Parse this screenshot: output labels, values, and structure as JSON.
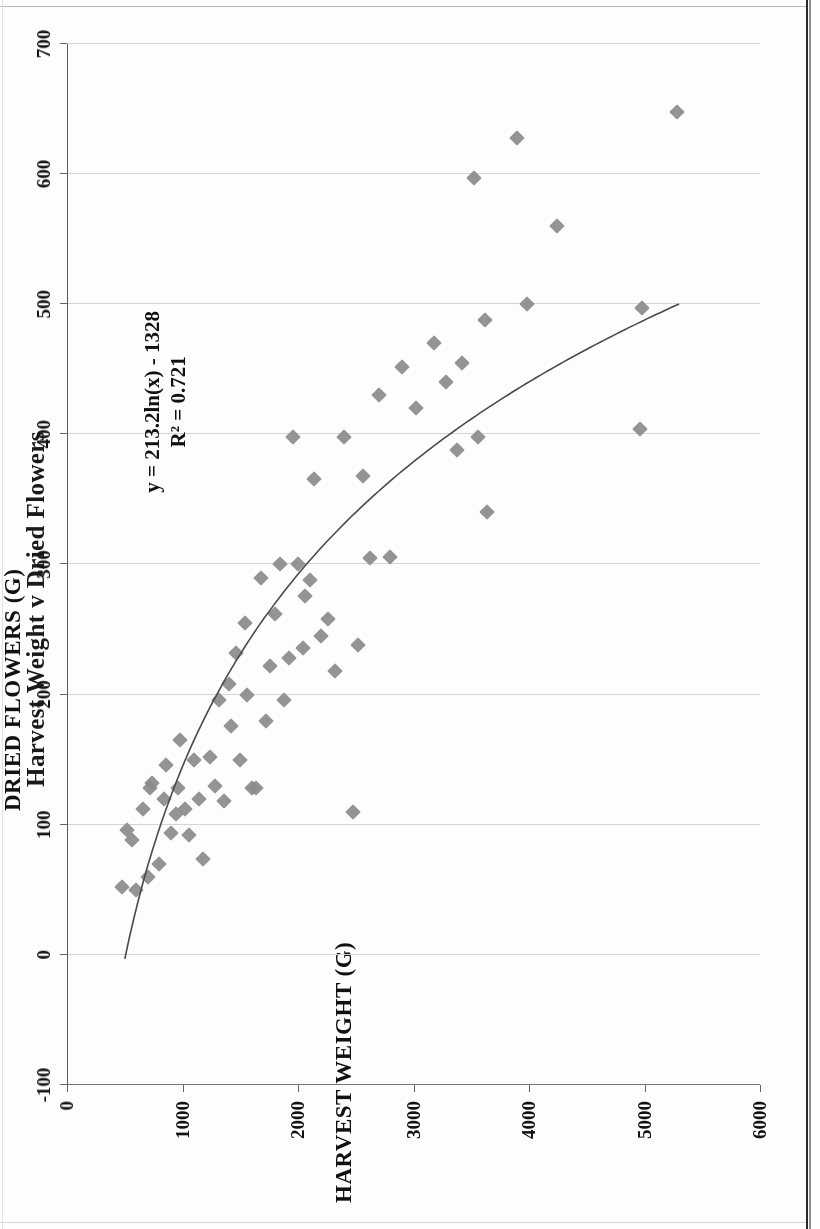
{
  "chart_data": {
    "type": "scatter",
    "title": "Harvest Weight v Dried Flowers",
    "xlabel": "HARVEST WEIGHT (G)",
    "ylabel": "DRIED FLOWERS (G)",
    "xlim": [
      0,
      6000
    ],
    "ylim": [
      -100,
      700
    ],
    "xticks": [
      "0",
      "1000",
      "2000",
      "3000",
      "4000",
      "5000",
      "6000"
    ],
    "yticks": [
      "-100",
      "0",
      "100",
      "200",
      "300",
      "400",
      "500",
      "600",
      "700"
    ],
    "grid": true,
    "legend": "none",
    "marker": "diamond",
    "marker_color": "#8b8b8b",
    "annotations": {
      "equation": "y = 213.2ln(x) - 1328",
      "r_squared": "R² = 0.721"
    },
    "trendline": {
      "type": "logarithmic",
      "label": "y = 213.2ln(x) - 1328",
      "coefficient": 213.2,
      "intercept": -1328,
      "r2": 0.721,
      "x_start": 500,
      "x_end": 5300
    },
    "points": [
      [
        480,
        52
      ],
      [
        520,
        96
      ],
      [
        560,
        88
      ],
      [
        600,
        50
      ],
      [
        660,
        112
      ],
      [
        700,
        60
      ],
      [
        720,
        128
      ],
      [
        740,
        132
      ],
      [
        800,
        70
      ],
      [
        840,
        120
      ],
      [
        860,
        146
      ],
      [
        900,
        94
      ],
      [
        940,
        108
      ],
      [
        960,
        128
      ],
      [
        980,
        165
      ],
      [
        1020,
        112
      ],
      [
        1060,
        92
      ],
      [
        1100,
        150
      ],
      [
        1140,
        120
      ],
      [
        1180,
        74
      ],
      [
        1240,
        152
      ],
      [
        1280,
        130
      ],
      [
        1320,
        196
      ],
      [
        1360,
        118
      ],
      [
        1400,
        208
      ],
      [
        1420,
        176
      ],
      [
        1460,
        232
      ],
      [
        1500,
        150
      ],
      [
        1540,
        255
      ],
      [
        1560,
        200
      ],
      [
        1600,
        128
      ],
      [
        1640,
        128
      ],
      [
        1680,
        290
      ],
      [
        1720,
        180
      ],
      [
        1760,
        222
      ],
      [
        1800,
        262
      ],
      [
        1840,
        300
      ],
      [
        1880,
        196
      ],
      [
        1920,
        228
      ],
      [
        1960,
        398
      ],
      [
        2000,
        300
      ],
      [
        2040,
        236
      ],
      [
        2060,
        276
      ],
      [
        2100,
        288
      ],
      [
        2140,
        366
      ],
      [
        2200,
        245
      ],
      [
        2260,
        258
      ],
      [
        2320,
        218
      ],
      [
        2400,
        398
      ],
      [
        2480,
        110
      ],
      [
        2520,
        238
      ],
      [
        2560,
        368
      ],
      [
        2620,
        305
      ],
      [
        2700,
        430
      ],
      [
        2800,
        306
      ],
      [
        2900,
        452
      ],
      [
        3020,
        420
      ],
      [
        3180,
        470
      ],
      [
        3280,
        440
      ],
      [
        3380,
        388
      ],
      [
        3420,
        455
      ],
      [
        3520,
        597
      ],
      [
        3560,
        398
      ],
      [
        3620,
        488
      ],
      [
        3640,
        340
      ],
      [
        3900,
        628
      ],
      [
        3980,
        500
      ],
      [
        4240,
        560
      ],
      [
        4960,
        404
      ],
      [
        4980,
        497
      ],
      [
        5280,
        648
      ]
    ]
  },
  "axes": {
    "x_title": "HARVEST WEIGHT (G)",
    "y_title": "DRIED FLOWERS (G)"
  }
}
